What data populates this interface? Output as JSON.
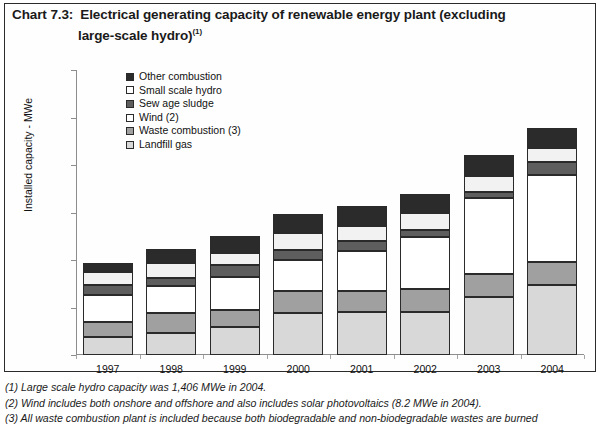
{
  "title": {
    "label": "Chart 7.3:",
    "line1": "Electrical generating capacity of renewable energy plant (excluding",
    "line2": "large-scale hydro)",
    "line2_sup": "(1)"
  },
  "chart_data": {
    "type": "bar",
    "stacked": true,
    "title": "Electrical generating capacity of renewable energy plant (excluding large-scale hydro)",
    "xlabel": "",
    "ylabel": "Installed capacity - MWe",
    "ylim": [
      0,
      3000
    ],
    "yticks": [
      "0",
      "500",
      "1,000",
      "1,500",
      "2,000",
      "2,500",
      "3,000"
    ],
    "ytick_values": [
      0,
      500,
      1000,
      1500,
      2000,
      2500,
      3000
    ],
    "grid": false,
    "legend_position": "upper-left-inside",
    "categories": [
      "1997",
      "1998",
      "1999",
      "2000",
      "2001",
      "2002",
      "2003",
      "2004"
    ],
    "series": [
      {
        "name": "Landfill gas",
        "color": "#d8d8d8",
        "values": [
          190,
          230,
          290,
          440,
          450,
          450,
          610,
          735
        ]
      },
      {
        "name": "Waste combustion (3)",
        "color": "#a0a0a0",
        "values": [
          160,
          210,
          180,
          230,
          225,
          240,
          245,
          245
        ]
      },
      {
        "name": "Wind (2)",
        "color": "#ffffff",
        "values": [
          285,
          285,
          355,
          335,
          420,
          555,
          800,
          915
        ]
      },
      {
        "name": "Sew age sludge",
        "color": "#5e5e5e",
        "values": [
          105,
          85,
          125,
          105,
          105,
          75,
          65,
          135
        ]
      },
      {
        "name": "Small scale hydro",
        "color": "#f2f2f2",
        "values": [
          135,
          160,
          125,
          170,
          160,
          170,
          165,
          150
        ]
      },
      {
        "name": "Other combustion",
        "color": "#2b2b2b",
        "values": [
          95,
          150,
          180,
          200,
          210,
          210,
          220,
          210
        ]
      }
    ],
    "totals": [
      970,
      1120,
      1255,
      1480,
      1570,
      1700,
      2105,
      2390
    ]
  },
  "legend": {
    "items": [
      {
        "label": "Other combustion",
        "color": "#2b2b2b"
      },
      {
        "label": "Small scale hydro",
        "color": "#ffffff"
      },
      {
        "label": "Sew age sludge",
        "color": "#5e5e5e"
      },
      {
        "label": "Wind (2)",
        "color": "#ffffff"
      },
      {
        "label": "Waste combustion (3)",
        "color": "#a0a0a0"
      },
      {
        "label": "Landfill gas",
        "color": "#d8d8d8"
      }
    ]
  },
  "footnotes": [
    "(1) Large scale hydro capacity was 1,406 MWe in 2004.",
    "(2) Wind includes both onshore and offshore and also includes solar photovoltaics (8.2 MWe in 2004).",
    "(3) All waste combustion plant is included because both biodegradable and non-biodegradable wastes are burned"
  ]
}
